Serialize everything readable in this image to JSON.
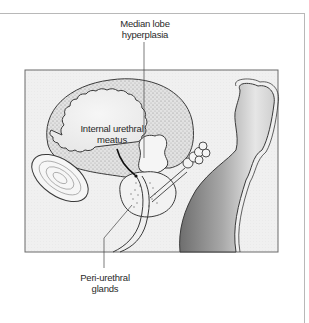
{
  "figure": {
    "labels": {
      "median_lobe": {
        "line1": "Median lobe",
        "line2": "hyperplasia"
      },
      "internal_meatus": {
        "line1": "Internal urethral",
        "line2": "meatus"
      },
      "periurethral": {
        "line1": "Peri-urethral",
        "line2": "glands"
      }
    },
    "colors": {
      "background": "#ffffff",
      "panel_fill": "#f1f1f1",
      "panel_border": "#6a6a6a",
      "frame_border": "#b8b8b8",
      "bladder_wall": "#d6d6d6",
      "outline": "#3a3a3a",
      "rectum_dark": "#8a8a8a",
      "rectum_light": "#e4e4e4"
    }
  }
}
